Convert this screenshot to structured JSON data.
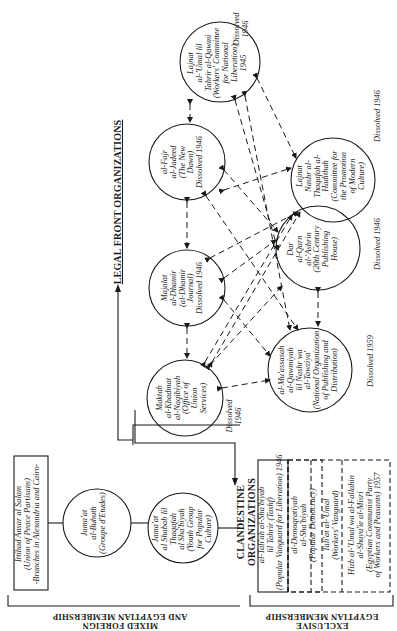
{
  "headings": {
    "legal_front": "LEGAL FRONT ORGANIZATIONS",
    "clandestine": [
      "CLANDESTINE",
      "ORGANIZATIONS"
    ]
  },
  "side_labels": {
    "mixed": [
      "MIXED FOREIGN",
      "AND EGYPTIAN MEMBERSHIP"
    ],
    "exclusive": [
      "EXCLUSIVE",
      "EGYPTIAN MEMBERSHIP"
    ]
  },
  "legal_nodes": [
    {
      "id": "lajnat_umal",
      "lines": [
        "Lajnat",
        "al-'Umal lil",
        "Tahrir al-Qawmi",
        "(Workers' Committee",
        "for National",
        "Liberation)",
        "1945"
      ],
      "status": [
        "Dissolved",
        "1946"
      ]
    },
    {
      "id": "fajr",
      "lines": [
        "al-Fajr",
        "al-Jadeed",
        "(The New",
        "Dawn)",
        "Dissolved 1946"
      ],
      "status": []
    },
    {
      "id": "majalat",
      "lines": [
        "Majalat",
        "al-Dhamir",
        "(al-Dhamir",
        "Journal)",
        "Dissolved 1946"
      ],
      "status": []
    },
    {
      "id": "maktab",
      "lines": [
        "Maktab",
        "al-Khadmat",
        "al-Naqibiyah",
        "(Office of",
        "Union",
        "Services)"
      ],
      "status": [
        "Dissolved",
        "1946"
      ]
    },
    {
      "id": "lajnat_nashr",
      "lines": [
        "Lajnat",
        "Nashr al-",
        "Thaqafah al-",
        "Hadithah",
        "(Committee for",
        "the Promotion",
        "of Modern",
        "Culture)"
      ],
      "status": [
        "Dissolved 1946"
      ]
    },
    {
      "id": "dar_qarn",
      "lines": [
        "Dar",
        "al-Qarn",
        "al-'Ashrin",
        "(20th Century",
        "Publishing",
        "House)"
      ],
      "status": [
        "Dissolved 1946"
      ]
    },
    {
      "id": "muassasah",
      "lines": [
        "al-Mu'assasah",
        "al-Qawmiyah",
        "lil Nashr wa",
        "al-Tawziya'",
        "(National Organization",
        "of Publishing and",
        "Distribution)"
      ],
      "status": [
        "Dissolved 1959"
      ]
    }
  ],
  "mixed_membership": {
    "box": [
      "Ittihad Ansar al Salam",
      "(Union of Peace Partisans)",
      "-Branches in Alexandria and Cairo-"
    ],
    "circle1": [
      "Jama'at",
      "al-Buhuth",
      "(Groupe d'Etudes)"
    ],
    "circle2": [
      "Jama'at",
      "al Shabab lil",
      "Thaqafah",
      "al Sha'biyah",
      "(Youth Group",
      "for Popular",
      "Culture)"
    ]
  },
  "clandestine_orgs": [
    {
      "lines": [
        "al-Tali'ah al-Sha'biyah",
        "lil Tahrir (Tashf)",
        "(Popular Vanguard for Liberation) 1946"
      ],
      "style": "solid"
    },
    {
      "lines": [
        "al-Demoqratiyah",
        "al-Sha'biyah",
        "(Popular Democracy)"
      ],
      "style": "dashed"
    },
    {
      "lines": [
        "Tali'at al-'Umal",
        "(Workers' Vanguard)"
      ],
      "style": "dashed"
    },
    {
      "lines": [
        "Hizb al-'Umal wa al-Fallahin",
        "al-Shuyu'ie al-Misri",
        "(Egyptian Communist Party",
        "of Workers and Peasants) 1957"
      ],
      "style": "dashed"
    }
  ],
  "colors": {
    "ink": "#1a1a1a",
    "background": "#ffffff"
  }
}
